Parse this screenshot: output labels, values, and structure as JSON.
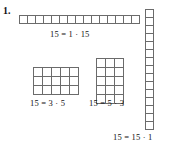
{
  "figure": {
    "item_number": "1.",
    "background_color": "#ffffff",
    "line_color": "#6b6b6b",
    "text_color": "#111111",
    "width": 172,
    "height": 147
  },
  "diagram_data": {
    "type": "rectangle-array-factorization",
    "subject": "Factor pairs of 15 shown as rectangular arrays of unit squares",
    "total": 15,
    "arrays": [
      {
        "id": "1x15",
        "name": "horizontal-strip",
        "rows": 1,
        "cols": 15,
        "cell_count": 15,
        "cell_size_px": 8,
        "caption": "15 = 1 · 15",
        "factor_a": 1,
        "factor_b": 15
      },
      {
        "id": "3x5",
        "name": "three-by-five-rectangle",
        "rows": 3,
        "cols": 5,
        "cell_count": 15,
        "cell_size_px": 9,
        "caption": "15 = 3 · 5",
        "factor_a": 3,
        "factor_b": 5
      },
      {
        "id": "5x3",
        "name": "five-by-three-rectangle",
        "rows": 5,
        "cols": 3,
        "cell_count": 15,
        "cell_size_px": 9,
        "caption": "15 = 5 · 3",
        "factor_a": 5,
        "factor_b": 3
      },
      {
        "id": "15x1",
        "name": "vertical-strip",
        "rows": 15,
        "cols": 1,
        "cell_count": 15,
        "cell_size_px": 8,
        "caption": "15 = 15 · 1",
        "factor_a": 15,
        "factor_b": 1
      }
    ]
  }
}
